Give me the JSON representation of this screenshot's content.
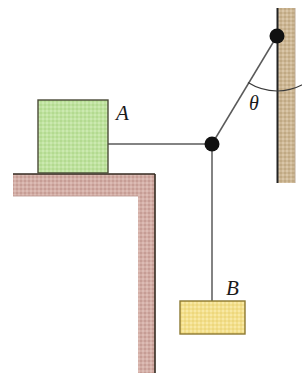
{
  "figure": {
    "type": "physics-free-body-diagram",
    "background_color": "#ffffff",
    "width": 302,
    "height": 386
  },
  "bodies": [
    {
      "id": "block-a",
      "label": "A",
      "label_x": 116,
      "label_y": 120,
      "shape": "rectangle",
      "x": 38,
      "y": 100,
      "width": 70,
      "height": 73,
      "fill_color": "#bce09b",
      "stroke_color": "#4a4a38",
      "description": "green block resting on the ledge"
    },
    {
      "id": "block-b",
      "label": "B",
      "label_x": 232,
      "label_y": 295,
      "shape": "rectangle",
      "x": 180,
      "y": 301,
      "width": 65,
      "height": 33,
      "fill_color": "#f2de8a",
      "stroke_color": "#8d7a33",
      "description": "yellow hanging block"
    }
  ],
  "structures": [
    {
      "id": "ledge",
      "shape": "L-bracket",
      "fill_color": "#ceaaa2",
      "stroke_color": "#3a2f2c",
      "horizontal_x": 13,
      "horizontal_y": 174,
      "horizontal_width": 142,
      "horizontal_height": 22,
      "vertical_x": 138,
      "vertical_y": 196,
      "vertical_width": 17,
      "vertical_height": 177,
      "description": "L-shaped support: horizontal shelf under block A with vertical column"
    },
    {
      "id": "right-wall",
      "shape": "rectangle",
      "fill_color": "#cbb694",
      "stroke_color": "#2b2b2b",
      "x": 277,
      "y": 8,
      "width": 18,
      "height": 175,
      "description": "tan vertical wall on the right that the upper cord anchors to"
    }
  ],
  "nodes": [
    {
      "id": "knot",
      "name": "cord-junction-knot",
      "x": 212,
      "y": 144,
      "radius": 7,
      "color": "#111111"
    },
    {
      "id": "wall-anchor",
      "name": "wall-anchor-point",
      "x": 277,
      "y": 36,
      "radius": 7,
      "color": "#111111"
    }
  ],
  "cords": [
    {
      "id": "cord-a-to-knot",
      "from": "block-a",
      "to": "knot",
      "x1": 108,
      "y1": 144,
      "x2": 212,
      "y2": 144,
      "orientation": "horizontal",
      "color": "#4d4d4d"
    },
    {
      "id": "cord-knot-to-wall",
      "from": "knot",
      "to": "wall-anchor",
      "x1": 212,
      "y1": 144,
      "x2": 277,
      "y2": 36,
      "orientation": "inclined",
      "color": "#4d4d4d"
    },
    {
      "id": "cord-knot-to-b",
      "from": "knot",
      "to": "block-b",
      "x1": 212,
      "y1": 144,
      "x2": 212,
      "y2": 301,
      "orientation": "vertical",
      "color": "#4d4d4d"
    }
  ],
  "angle": {
    "id": "theta",
    "symbol": "θ",
    "label_x": 256,
    "label_y": 107,
    "vertex_x": 277,
    "vertex_y": 36,
    "between": [
      "cord-knot-to-wall",
      "right-wall"
    ],
    "arc_radius": 55,
    "description": "angle between the inclined cord and the vertical wall at the anchor point"
  }
}
